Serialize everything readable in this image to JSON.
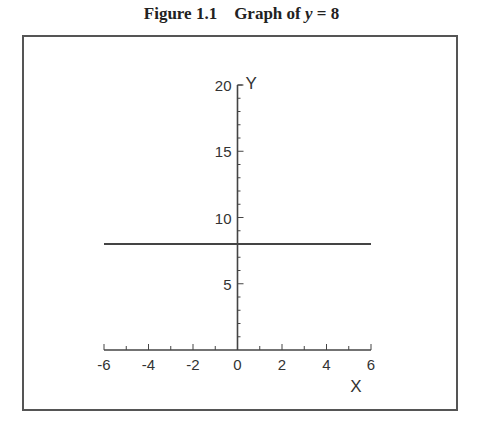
{
  "figure": {
    "label": "Figure 1.1",
    "title_prefix": "Graph of ",
    "title_var": "y",
    "title_suffix": " = 8"
  },
  "chart_data": {
    "type": "line",
    "xlabel": "X",
    "ylabel": "Y",
    "xlim": [
      -6,
      6
    ],
    "ylim": [
      0,
      20
    ],
    "x_ticks": [
      -6,
      -4,
      -2,
      0,
      2,
      4,
      6
    ],
    "y_ticks": [
      5,
      10,
      15,
      20
    ],
    "grid": false,
    "legend": null,
    "series": [
      {
        "name": "y = 8",
        "x": [
          -6,
          6
        ],
        "y": [
          8,
          8
        ],
        "color": "#444444"
      }
    ]
  }
}
